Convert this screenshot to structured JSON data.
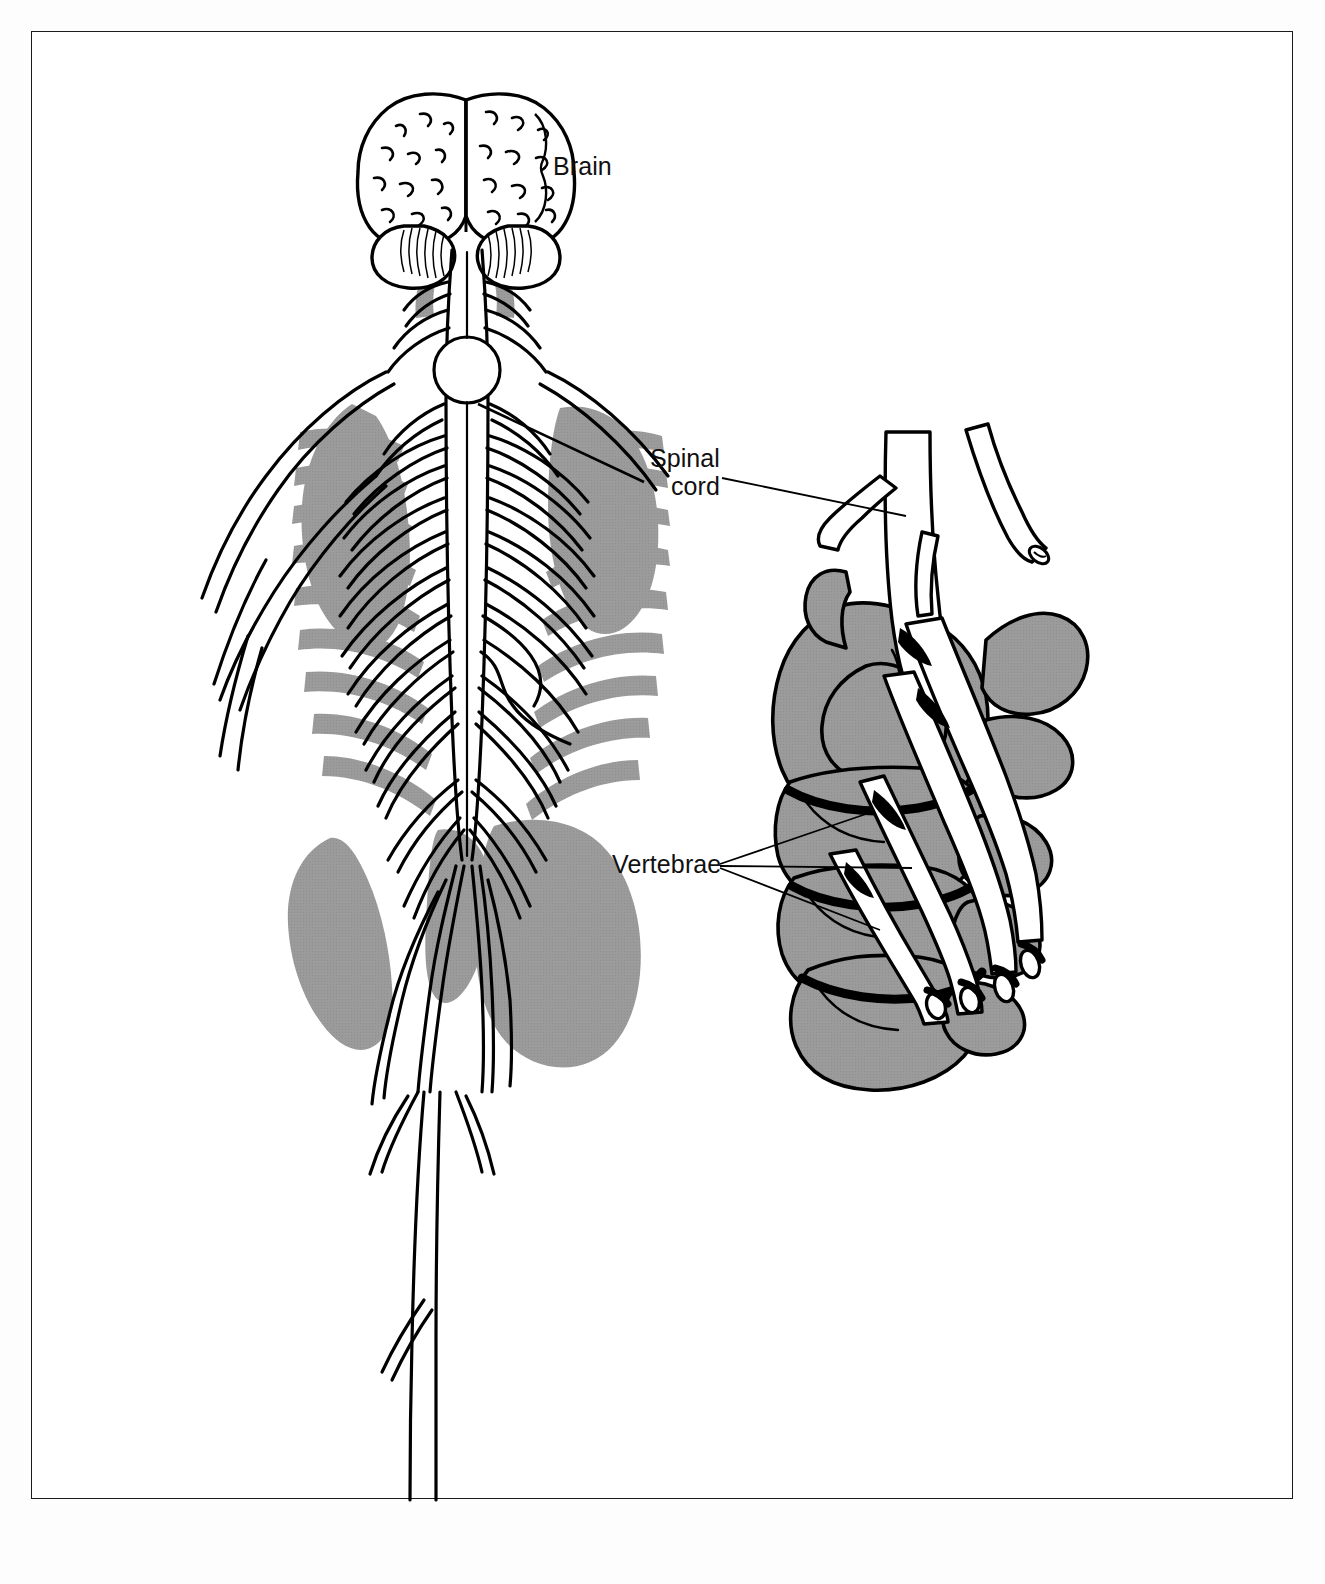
{
  "figure": {
    "domain": "anatomical-illustration",
    "background_color": "#ffffff",
    "border_color": "#1a1a1a",
    "ink_color": "#000000",
    "shadow_gray": "#9b9b9b"
  },
  "labels": {
    "brain": "Brain",
    "spinal_cord_line1": "Spinal",
    "spinal_cord_line2": "cord",
    "vertebrae": "Vertebrae"
  },
  "diagram_parts": {
    "left_figure": [
      "brain-cerebrum-left-hemisphere",
      "brain-cerebrum-right-hemisphere",
      "cerebellum-left-lobe",
      "cerebellum-right-lobe",
      "brainstem",
      "cervical-spinal-cord",
      "thoracic-spinal-cord",
      "lumbar-spinal-cord",
      "cauda-equina",
      "intercostal-nerves",
      "brachial-plexus",
      "sciatic-nerve",
      "rib-cage-shadow",
      "scapula-shadow",
      "pelvis-sacrum-shadow"
    ],
    "right_detail": [
      "spinal-cord-in-canal",
      "cut-nerve-root-end",
      "vertebra-cutaway-foramen",
      "vertebral-body-stack",
      "spinous-process",
      "transverse-process",
      "emerging-nerve-roots",
      "nerve-root-cut-cross-sections"
    ]
  },
  "leaders": {
    "brain_leader": "brace from label to cerebral hemispheres",
    "spinal_cord_leader": "single line from label to cord in vertebral canal",
    "vertebrae_leaders": "three lines fanning from label to three vertebral bodies"
  }
}
